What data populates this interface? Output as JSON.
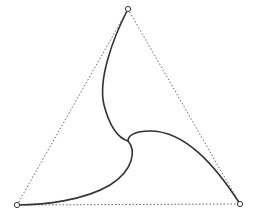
{
  "diagram": {
    "background": "#ffffff",
    "stroke_color": "#333333",
    "dotted_color": "#666666",
    "vertices": [
      {
        "name": "top",
        "x": 128,
        "y": 9
      },
      {
        "name": "bottom-left",
        "x": 17,
        "y": 205
      },
      {
        "name": "bottom-right",
        "x": 240,
        "y": 204
      }
    ],
    "triangle_edges": [
      {
        "from": "top",
        "to": "bottom-left",
        "style": "dotted"
      },
      {
        "from": "top",
        "to": "bottom-right",
        "style": "dotted"
      },
      {
        "from": "bottom-left",
        "to": "bottom-right",
        "style": "dotted"
      }
    ],
    "center": {
      "x": 128,
      "y": 141
    },
    "curves": [
      {
        "name": "top-arm",
        "d": "M 128 9 C 112 40, 98 80, 104 105 C 110 128, 118 138, 128 141"
      },
      {
        "name": "right-arm",
        "d": "M 128 141 C 128 136, 134 131, 150 131 C 185 131, 215 165, 240 204"
      },
      {
        "name": "bottom-arm",
        "d": "M 128 141 C 136 150, 134 170, 110 185 C 85 200, 45 205, 17 205"
      }
    ]
  }
}
